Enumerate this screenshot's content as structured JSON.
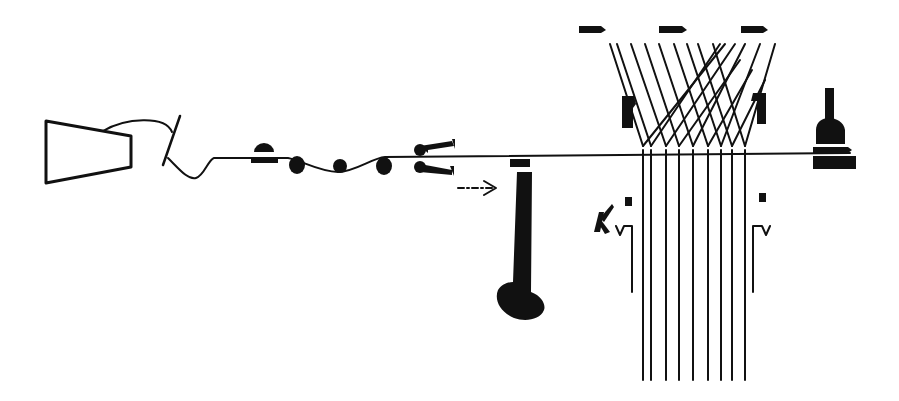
{
  "diagram": {
    "type": "machine-schematic",
    "colors": {
      "ink": "#111111",
      "background": "#ffffff"
    },
    "components": [
      {
        "id": "yarn-package",
        "label": ""
      },
      {
        "id": "thread-guide",
        "label": ""
      },
      {
        "id": "tension-device",
        "label": ""
      },
      {
        "id": "tension-rollers",
        "label": ""
      },
      {
        "id": "stop-motion-feelers",
        "label": ""
      },
      {
        "id": "movement-arrow",
        "label": ""
      },
      {
        "id": "swing-lever",
        "label": ""
      },
      {
        "id": "guide-bar-shogs",
        "label": ""
      },
      {
        "id": "yarn-lattice",
        "label": ""
      },
      {
        "id": "side-clamps",
        "label": ""
      },
      {
        "id": "cutter",
        "label": ""
      },
      {
        "id": "sinkers",
        "label": ""
      },
      {
        "id": "needles",
        "label": ""
      },
      {
        "id": "take-up-weight",
        "label": ""
      }
    ],
    "needle_count": 9,
    "lattice_line_count": 12,
    "shog_count": 3
  }
}
